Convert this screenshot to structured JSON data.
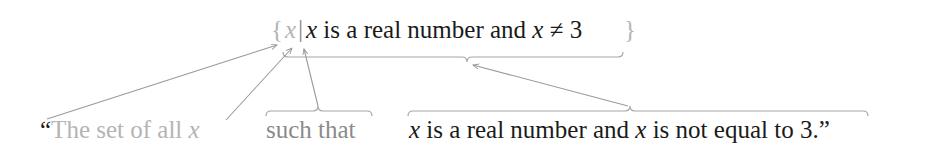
{
  "notation": {
    "open_brace": "{",
    "variable": "x",
    "bar": "|",
    "condition_var1": "x",
    "condition_text1": " is a real number and ",
    "condition_var2": "x",
    "condition_op": " ≠ 3",
    "close_brace": "}"
  },
  "translation": {
    "open_quote": "“",
    "set_of_all": "The set of all ",
    "set_var": "x",
    "such_that": "such that",
    "cond_var1": "x",
    "cond_text": " is a real number and ",
    "cond_var2": "x",
    "cond_tail": " is not equal to 3.”"
  },
  "colors": {
    "primary_text": "#1a1a1a",
    "faded_text": "#b4b4b4",
    "mid_text": "#8a8a8a",
    "annotation_lines": "#9a9a9a"
  }
}
